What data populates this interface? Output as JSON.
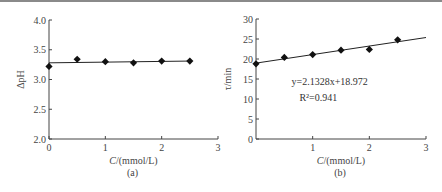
{
  "chart_data": [
    {
      "type": "scatter",
      "panel_label": "(a)",
      "xlabel_italic": "C",
      "xlabel_rest": "/(mmol/L)",
      "ylabel": "ΔpH",
      "xlim": [
        0,
        3
      ],
      "ylim": [
        2.0,
        4.0
      ],
      "xticks": [
        "0",
        "1",
        "2",
        "3"
      ],
      "xtick_values": [
        0,
        1,
        2,
        3
      ],
      "yticks": [
        "2.0",
        "2.5",
        "3.0",
        "3.5",
        "4.0"
      ],
      "ytick_values": [
        2.0,
        2.5,
        3.0,
        3.5,
        4.0
      ],
      "marker": "diamond",
      "x": [
        0,
        0.5,
        1,
        1.5,
        2,
        2.5
      ],
      "y": [
        3.22,
        3.34,
        3.3,
        3.28,
        3.31,
        3.31
      ],
      "fit_line": {
        "x": [
          0,
          2.5
        ],
        "y": [
          3.28,
          3.31
        ]
      },
      "grid": false
    },
    {
      "type": "scatter",
      "panel_label": "(b)",
      "xlabel_italic": "C",
      "xlabel_rest": "/(mmol/L)",
      "ylabel": "τ/min",
      "xlim": [
        0,
        3
      ],
      "ylim": [
        0,
        30
      ],
      "xticks": [
        "1",
        "2",
        "3"
      ],
      "xtick_values": [
        1,
        2,
        3
      ],
      "yticks": [
        "0",
        "5",
        "10",
        "15",
        "20",
        "25",
        "30"
      ],
      "ytick_values": [
        0,
        5,
        10,
        15,
        20,
        25,
        30
      ],
      "marker": "diamond",
      "x": [
        0,
        0.5,
        1,
        1.5,
        2,
        2.5
      ],
      "y": [
        18.8,
        20.4,
        21.1,
        22.2,
        22.4,
        24.8
      ],
      "fit_line": {
        "slope": 2.1328,
        "intercept": 18.972,
        "x": [
          0,
          3
        ]
      },
      "annotation_equation": "y=2.1328x+18.972",
      "annotation_r2": "R²=0.941",
      "grid": false
    }
  ]
}
